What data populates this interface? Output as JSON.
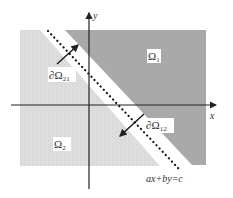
{
  "diagram": {
    "type": "domain-decomposition",
    "colors": {
      "background": "#ffffff",
      "omega1_fill": "#a9a9a9",
      "omega2_fill": "#dcdcdc",
      "axis": "#222222",
      "dotted_line": "#111111",
      "label_text": "#333333"
    },
    "axes": {
      "x_label": "x",
      "y_label": "y"
    },
    "regions": [
      {
        "id": "omega1",
        "label": "Ω",
        "subscript": "1",
        "shade": "dark"
      },
      {
        "id": "omega2",
        "label": "Ω",
        "subscript": "2",
        "shade": "light"
      }
    ],
    "boundaries": [
      {
        "id": "boundary21",
        "label": "∂Ω",
        "subscript": "21"
      },
      {
        "id": "boundary12",
        "label": "∂Ω",
        "subscript": "12"
      }
    ],
    "interface_line": {
      "equation": "ax+by=c",
      "style": "dotted"
    }
  }
}
